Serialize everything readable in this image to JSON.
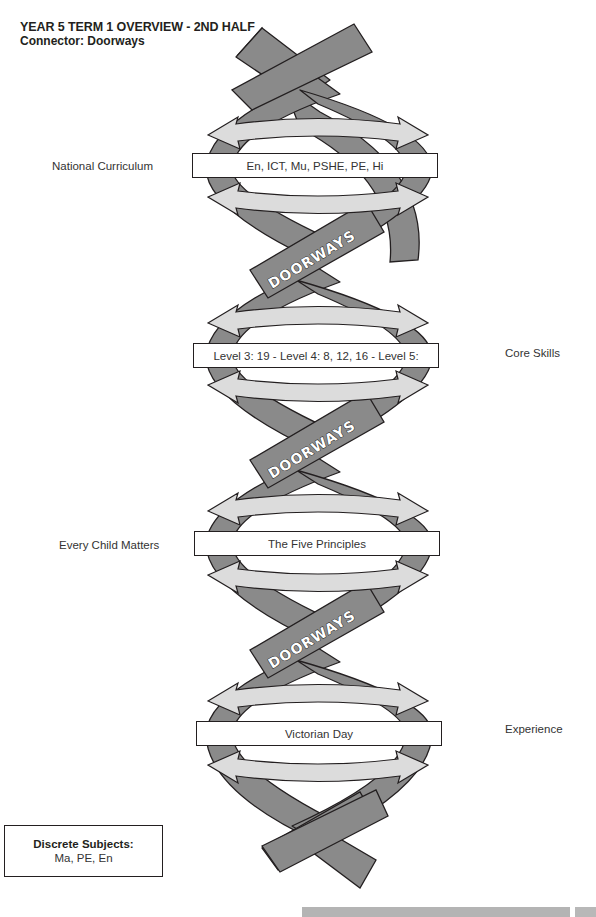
{
  "header": {
    "title": "YEAR 5 TERM 1 OVERVIEW - 2ND HALF",
    "connector": "Connector: Doorways"
  },
  "helix": {
    "strand_color": "#8a8a8a",
    "arrow_color": "#dcdcdc",
    "outline_color": "#231f20",
    "crossing_label": "DOORWAYS",
    "crossings": [
      {
        "label": "DOORWAYS"
      },
      {
        "label": "DOORWAYS"
      },
      {
        "label": "DOORWAYS"
      }
    ]
  },
  "rows": [
    {
      "side": "left",
      "category": "National Curriculum",
      "content": "En, ICT, Mu, PSHE, PE, Hi"
    },
    {
      "side": "right",
      "category": "Core Skills",
      "content": "Level 3: 19 - Level 4: 8, 12, 16 - Level 5:"
    },
    {
      "side": "left",
      "category": "Every Child Matters",
      "content": "The Five Principles"
    },
    {
      "side": "right",
      "category": "Experience",
      "content": "Victorian Day"
    }
  ],
  "discrete": {
    "heading": "Discrete Subjects:",
    "subjects": "Ma, PE, En"
  }
}
